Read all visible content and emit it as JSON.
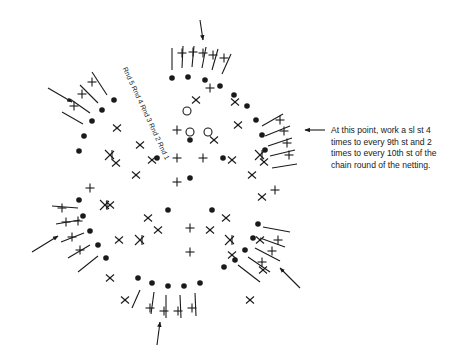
{
  "diagram": {
    "type": "crochet-chart",
    "round_labels": [
      "Rnd 5",
      "Rnd 4",
      "Rnd 3",
      "Rnd 2",
      "Rnd 1"
    ],
    "round_label_text": "Rnd 5 Rnd 4 Rnd 3 Rnd 2 Rnd 1",
    "annotation": {
      "lines": [
        "At this point, work a sl st 4",
        "times to every 9th st and 2",
        "times to every 10th st of the",
        "chain round of the netting."
      ]
    },
    "symbols": {
      "dot": "slip-stitch",
      "x": "single-crochet",
      "plus": "single-crochet",
      "circle": "chain",
      "tall": "double-crochet"
    },
    "arrows": [
      "top",
      "top-left",
      "left",
      "bottom",
      "bottom-right",
      "right"
    ],
    "stroke_color": "#1a1a1a"
  }
}
